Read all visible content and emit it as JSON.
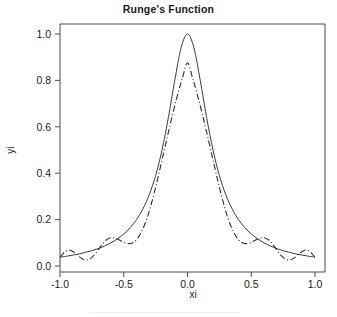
{
  "chart_data": {
    "type": "line",
    "title": "Runge's Function",
    "xlabel": "xi",
    "ylabel": "yi",
    "xlim": [
      -1.0,
      1.0
    ],
    "ylim": [
      0.0,
      1.0
    ],
    "grid": false,
    "legend": "none",
    "xticks": [
      -1.0,
      -0.5,
      0.0,
      0.5,
      1.0
    ],
    "xtick_labels": [
      "-1.0",
      "-0.5",
      "0.0",
      "0.5",
      "1.0"
    ],
    "yticks": [
      0.0,
      0.2,
      0.4,
      0.6,
      0.8,
      1.0
    ],
    "ytick_labels": [
      "0.0",
      "0.2",
      "0.4",
      "0.6",
      "0.8",
      "1.0"
    ],
    "series": [
      {
        "name": "Runge function 1/(1+25x^2)",
        "style": "solid",
        "color": "#3d3d3d",
        "x": [
          -1.0,
          -0.95,
          -0.9,
          -0.85,
          -0.8,
          -0.75,
          -0.7,
          -0.65,
          -0.6,
          -0.55,
          -0.5,
          -0.45,
          -0.4,
          -0.35,
          -0.3,
          -0.25,
          -0.2,
          -0.15,
          -0.1,
          -0.05,
          0.0,
          0.05,
          0.1,
          0.15,
          0.2,
          0.25,
          0.3,
          0.35,
          0.4,
          0.45,
          0.5,
          0.55,
          0.6,
          0.65,
          0.7,
          0.75,
          0.8,
          0.85,
          0.9,
          0.95,
          1.0
        ],
        "y": [
          0.038,
          0.042,
          0.047,
          0.052,
          0.059,
          0.066,
          0.075,
          0.086,
          0.1,
          0.117,
          0.138,
          0.165,
          0.2,
          0.246,
          0.308,
          0.39,
          0.5,
          0.64,
          0.8,
          0.941,
          1.0,
          0.941,
          0.8,
          0.64,
          0.5,
          0.39,
          0.308,
          0.246,
          0.2,
          0.165,
          0.138,
          0.117,
          0.1,
          0.086,
          0.075,
          0.066,
          0.059,
          0.052,
          0.047,
          0.042,
          0.038
        ]
      },
      {
        "name": "Polynomial interpolant (Runge phenomenon)",
        "style": "dashdot",
        "color": "#2b2b2b",
        "x": [
          -1.0,
          -0.96,
          -0.92,
          -0.88,
          -0.84,
          -0.8,
          -0.76,
          -0.72,
          -0.68,
          -0.64,
          -0.6,
          -0.56,
          -0.52,
          -0.48,
          -0.44,
          -0.4,
          -0.36,
          -0.32,
          -0.28,
          -0.24,
          -0.2,
          -0.16,
          -0.12,
          -0.08,
          -0.04,
          0.0,
          0.04,
          0.08,
          0.12,
          0.16,
          0.2,
          0.24,
          0.28,
          0.32,
          0.36,
          0.4,
          0.44,
          0.48,
          0.52,
          0.56,
          0.6,
          0.64,
          0.68,
          0.72,
          0.76,
          0.8,
          0.84,
          0.88,
          0.92,
          0.96,
          1.0
        ],
        "y": [
          0.038,
          0.062,
          0.068,
          0.055,
          0.036,
          0.026,
          0.033,
          0.055,
          0.085,
          0.111,
          0.122,
          0.119,
          0.108,
          0.098,
          0.098,
          0.113,
          0.148,
          0.202,
          0.275,
          0.362,
          0.457,
          0.553,
          0.646,
          0.733,
          0.81,
          0.876,
          0.81,
          0.733,
          0.646,
          0.553,
          0.457,
          0.362,
          0.275,
          0.202,
          0.148,
          0.113,
          0.098,
          0.098,
          0.108,
          0.119,
          0.122,
          0.111,
          0.085,
          0.055,
          0.033,
          0.026,
          0.036,
          0.055,
          0.068,
          0.062,
          0.038
        ]
      }
    ]
  },
  "axes": {
    "title_text": "Runge's Function",
    "x_axis_title": "xi",
    "y_axis_title": "yi"
  }
}
